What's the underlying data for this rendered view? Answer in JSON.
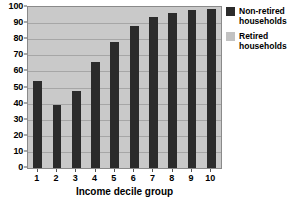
{
  "chart_data": {
    "type": "bar",
    "title": "",
    "subtitle": "",
    "xlabel": "Income decile group",
    "ylabel": "",
    "categories": [
      "1",
      "2",
      "3",
      "4",
      "5",
      "6",
      "7",
      "8",
      "9",
      "10"
    ],
    "ylim": [
      0,
      100
    ],
    "yticks": [
      0,
      10,
      20,
      30,
      40,
      50,
      60,
      70,
      80,
      90,
      100
    ],
    "grid": true,
    "stacked": true,
    "legend_position": "right",
    "series": [
      {
        "name": "Retired households",
        "color": "#c2c2c2",
        "values": [
          46,
          61,
          52,
          34,
          22,
          12,
          6,
          4,
          2,
          1
        ]
      },
      {
        "name": "Non-retired households",
        "color": "#2b2b2b",
        "values": [
          54,
          39,
          48,
          66,
          78,
          88,
          94,
          96,
          98,
          99
        ]
      }
    ]
  },
  "yaxis": {
    "ticks": [
      "0",
      "10",
      "20",
      "30",
      "40",
      "50",
      "60",
      "70",
      "80",
      "90",
      "100"
    ]
  },
  "xaxis": {
    "label": "Income decile group",
    "ticks": [
      "1",
      "2",
      "3",
      "4",
      "5",
      "6",
      "7",
      "8",
      "9",
      "10"
    ]
  },
  "legend": {
    "items": [
      {
        "label": "Non-retired\nhouseholds",
        "color": "#2b2b2b"
      },
      {
        "label": "Retired\nhouseholds",
        "color": "#c2c2c2"
      }
    ]
  },
  "colors": {
    "non_retired": "#2b2b2b",
    "retired": "#c2c2c2",
    "plot_background": "#c9c9c9",
    "gridline": "#a6a6a6",
    "axis": "#555555"
  }
}
